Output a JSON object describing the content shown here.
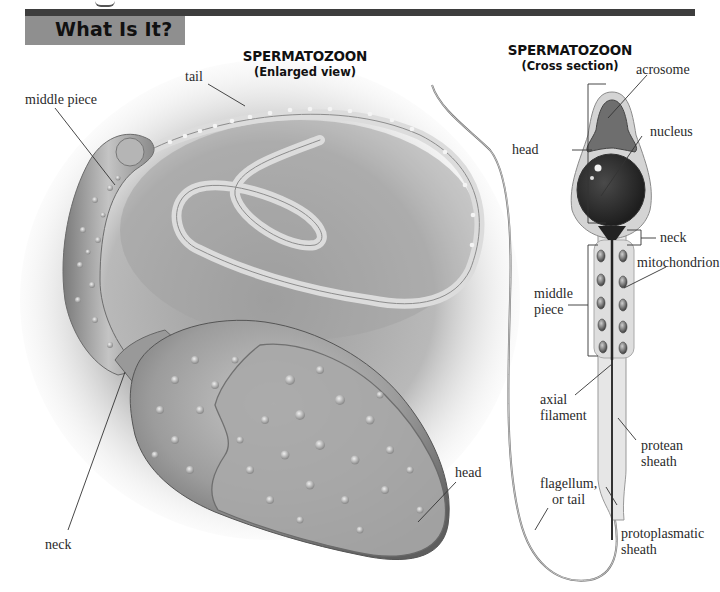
{
  "page": {
    "section_tab": "What Is It?",
    "accent_colors": {
      "top_rule": "#3d3d3d",
      "section_tab_bg": "#8f8f8f",
      "text": "#111111"
    }
  },
  "enlarged_figure": {
    "title": "SPERMATOZOON",
    "subtitle": "(Enlarged view)",
    "labels": {
      "tail": "tail",
      "middle_piece": "middle piece",
      "neck": "neck",
      "head": "head"
    }
  },
  "cross_section_figure": {
    "title": "SPERMATOZOON",
    "subtitle": "(Cross section)",
    "labels": {
      "acrosome": "acrosome",
      "head": "head",
      "nucleus": "nucleus",
      "neck": "neck",
      "mitochondrion": "mitochondrion",
      "middle_piece_line1": "middle",
      "middle_piece_line2": "piece",
      "axial_filament_line1": "axial",
      "axial_filament_line2": "filament",
      "protean_sheath_line1": "protean",
      "protean_sheath_line2": "sheath",
      "flagellum_line1": "flagellum,",
      "flagellum_line2": "or tail",
      "protoplasmatic_sheath_line1": "protoplasmatic",
      "protoplasmatic_sheath_line2": "sheath"
    }
  }
}
